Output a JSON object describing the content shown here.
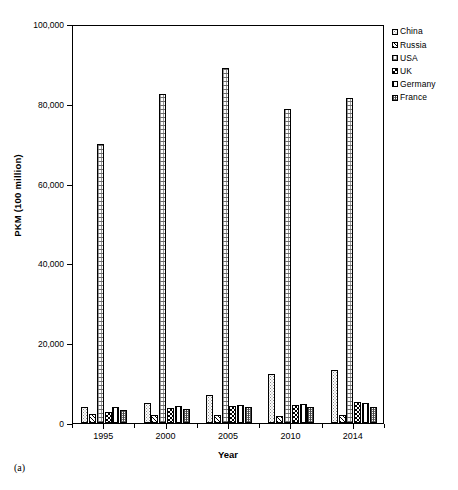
{
  "figure": {
    "caption": "(a)"
  },
  "chart_data": {
    "type": "bar",
    "title": "",
    "xlabel": "Year",
    "ylabel": "PKM (100 million)",
    "categories": [
      "1995",
      "2000",
      "2005",
      "2010",
      "2014"
    ],
    "ylim": [
      0,
      100000
    ],
    "yticks": [
      0,
      20000,
      40000,
      60000,
      80000,
      100000
    ],
    "ytick_labels": [
      "0",
      "20,000",
      "40,000",
      "60,000",
      "80,000",
      "100,000"
    ],
    "grid": false,
    "legend_position": "top-right",
    "series": [
      {
        "name": "China",
        "pattern": "dotted-light",
        "values": [
          3900,
          4900,
          7000,
          12200,
          13200
        ]
      },
      {
        "name": "Russia",
        "pattern": "diagonal-hatch",
        "values": [
          2200,
          1900,
          1900,
          1700,
          2100
        ]
      },
      {
        "name": "USA",
        "pattern": "fine-grid",
        "values": [
          70000,
          82500,
          89000,
          78700,
          81400
        ]
      },
      {
        "name": "UK",
        "pattern": "checkerboard",
        "values": [
          2800,
          3800,
          4200,
          4600,
          5300
        ]
      },
      {
        "name": "Germany",
        "pattern": "vertical-lines",
        "values": [
          3900,
          4200,
          4500,
          4700,
          5000
        ]
      },
      {
        "name": "France",
        "pattern": "cross-hatch-gray",
        "values": [
          3300,
          3600,
          3900,
          4000,
          4100
        ]
      }
    ]
  },
  "legend": {
    "entries": [
      "China",
      "Russia",
      "USA",
      "UK",
      "Germany",
      "France"
    ]
  }
}
